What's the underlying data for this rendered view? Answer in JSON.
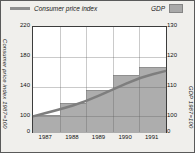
{
  "legend": {
    "cpi_label": "Consumer price index",
    "gdp_label": "GDP"
  },
  "axes": {
    "left": {
      "title": "Consumer price index 1987=100",
      "ticks": [
        "220",
        "180",
        "140",
        "100",
        "0"
      ]
    },
    "right": {
      "title": "GDP 1987=100",
      "ticks": [
        "130",
        "120",
        "110",
        "100",
        "0"
      ]
    },
    "x": {
      "ticks": [
        "1987",
        "1988",
        "1989",
        "1990",
        "1991"
      ]
    }
  },
  "chart_data": {
    "type": "combo-bar-line",
    "categories": [
      "1987",
      "1988",
      "1989",
      "1990",
      "1991"
    ],
    "series": [
      {
        "name": "GDP",
        "type": "bar",
        "axis": "right",
        "values": [
          100.5,
          104.5,
          109,
          114,
          116.5
        ]
      },
      {
        "name": "Consumer price index",
        "type": "line",
        "axis": "left",
        "values_at_category_edges": [
          100,
          109,
          120,
          136,
          152,
          161
        ]
      }
    ],
    "left_axis": {
      "label": "Consumer price index 1987=100",
      "ticks": [
        220,
        180,
        140,
        100,
        0
      ],
      "note": "broken scale: 0 baseline then 100-220"
    },
    "right_axis": {
      "label": "GDP 1987=100",
      "ticks": [
        130,
        120,
        110,
        100,
        0
      ],
      "note": "broken scale: 0 baseline then 100-130"
    },
    "x_axis": {
      "ticks": [
        1987,
        1988,
        1989,
        1990,
        1991
      ]
    },
    "legend_position": "top",
    "grid": true,
    "colors": {
      "bar": "#adadad",
      "line": "#7e7e7e",
      "plot_bg": "#ffffff",
      "figure_bg": "#f0efec",
      "grid": "#c9c9c9"
    }
  }
}
